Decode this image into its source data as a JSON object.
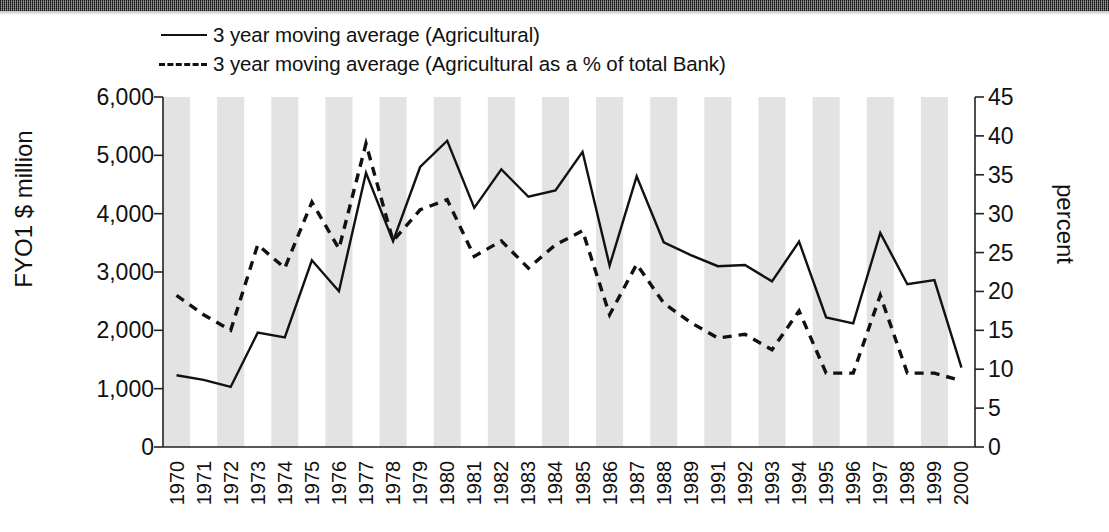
{
  "legend": {
    "position": "top-left",
    "items": [
      {
        "style": "solid",
        "label": "3 year moving average (Agricultural)"
      },
      {
        "style": "dashed",
        "label": "3 year moving average (Agricultural as a % of total Bank)"
      }
    ]
  },
  "axes": {
    "left": {
      "title": "FYO1 $ million",
      "ticks": [
        "0",
        "1,000",
        "2,000",
        "3,000",
        "4,000",
        "5,000",
        "6,000"
      ],
      "min": 0,
      "max": 6000,
      "step": 1000
    },
    "right": {
      "title": "percent",
      "ticks": [
        "0",
        "5",
        "10",
        "15",
        "20",
        "25",
        "30",
        "35",
        "40",
        "45"
      ],
      "min": 0,
      "max": 45,
      "step": 5
    }
  },
  "chart_data": {
    "type": "line",
    "title": "",
    "xlabel": "",
    "ylabel": "FYO1 $ million",
    "y2label": "percent",
    "ylim": [
      0,
      6000
    ],
    "y2lim": [
      0,
      45
    ],
    "grid": false,
    "banded_background": true,
    "legend_position": "top-left",
    "categories": [
      "1970",
      "1971",
      "1972",
      "1973",
      "1974",
      "1975",
      "1976",
      "1977",
      "1978",
      "1979",
      "1980",
      "1981",
      "1982",
      "1983",
      "1984",
      "1985",
      "1986",
      "1987",
      "1988",
      "1989",
      "1991",
      "1992",
      "1993",
      "1994",
      "1995",
      "1996",
      "1997",
      "1998",
      "1999",
      "2000"
    ],
    "series": [
      {
        "name": "3 year moving average (Agricultural)",
        "style": "solid",
        "axis": "left",
        "unit": "FYO1 $ million",
        "values": [
          1230,
          1150,
          1030,
          1960,
          1880,
          3200,
          2670,
          4700,
          3530,
          4800,
          5250,
          4100,
          4760,
          4290,
          4400,
          5060,
          3110,
          4640,
          3510,
          3290,
          3100,
          3120,
          2840,
          3520,
          2220,
          2120,
          3670,
          2790,
          2860,
          1360
        ]
      },
      {
        "name": "3 year moving average (Agricultural as a % of total Bank)",
        "style": "dashed",
        "axis": "right",
        "unit": "percent",
        "values": [
          19.5,
          17.0,
          15.0,
          26.0,
          23.0,
          31.5,
          25.5,
          39.0,
          26.5,
          30.5,
          31.8,
          24.5,
          26.5,
          23.0,
          26.0,
          27.8,
          17.0,
          23.5,
          18.5,
          16.0,
          14.0,
          14.5,
          12.5,
          17.5,
          9.5,
          9.5,
          19.5,
          9.5,
          9.5,
          8.5
        ]
      }
    ]
  }
}
